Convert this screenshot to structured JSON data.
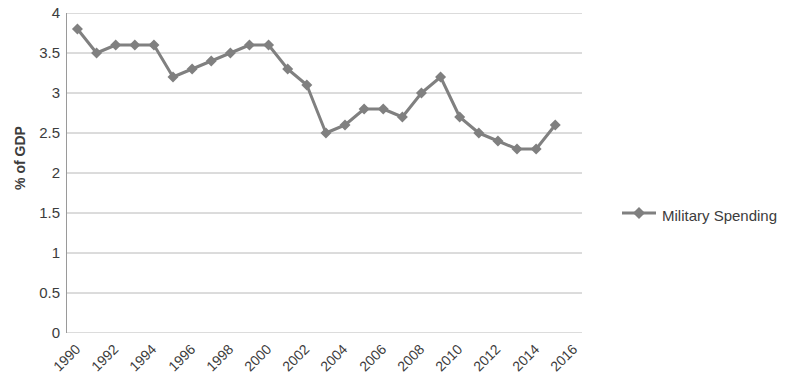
{
  "chart_data": {
    "type": "line",
    "title": "",
    "xlabel": "",
    "ylabel": "% of GDP",
    "ylim": [
      0,
      4
    ],
    "ytick_step": 0.5,
    "yticks": [
      "0",
      "0.5",
      "1",
      "1.5",
      "2",
      "2.5",
      "3",
      "3.5",
      "4"
    ],
    "grid": true,
    "legend_position": "right",
    "xlim": [
      1990,
      2016
    ],
    "xtick_step": 2,
    "xticks": [
      "1990",
      "1992",
      "1994",
      "1996",
      "1998",
      "2000",
      "2002",
      "2004",
      "2006",
      "2008",
      "2010",
      "2012",
      "2014",
      "2016"
    ],
    "x": [
      1990,
      1991,
      1992,
      1993,
      1994,
      1995,
      1996,
      1997,
      1998,
      1999,
      2000,
      2001,
      2002,
      2003,
      2004,
      2005,
      2006,
      2007,
      2008,
      2009,
      2010,
      2011,
      2012,
      2013,
      2014,
      2015
    ],
    "series": [
      {
        "name": "Military Spending",
        "color": "#808080",
        "marker": "diamond",
        "values": [
          3.8,
          3.5,
          3.6,
          3.6,
          3.6,
          3.2,
          3.3,
          3.4,
          3.5,
          3.6,
          3.6,
          3.3,
          3.1,
          2.5,
          2.6,
          2.8,
          2.8,
          2.7,
          3.0,
          3.2,
          2.7,
          2.5,
          2.4,
          2.3,
          2.3,
          2.6
        ]
      }
    ]
  },
  "legend": {
    "entries": [
      {
        "label": "Military Spending",
        "color": "#808080"
      }
    ]
  },
  "axis": {
    "y_title": "% of GDP"
  },
  "colors": {
    "series": "#808080",
    "gridline": "#b8b8b8",
    "axis": "#9a9a9a",
    "text": "#3c3c3c"
  }
}
